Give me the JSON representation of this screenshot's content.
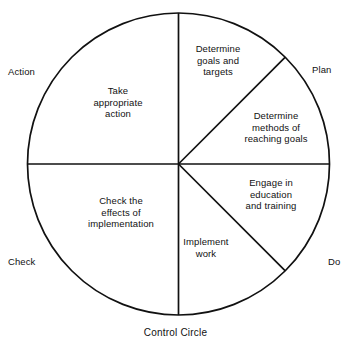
{
  "caption": "Control Circle",
  "geometry": {
    "center_x": 178.5,
    "center_y": 164,
    "radius": 151
  },
  "outer_labels": [
    {
      "id": "action",
      "label": "Action"
    },
    {
      "id": "plan",
      "label": "Plan"
    },
    {
      "id": "check",
      "label": "Check"
    },
    {
      "id": "do",
      "label": "Do"
    }
  ],
  "sectors": [
    {
      "id": "plan-goals",
      "phase": "Plan",
      "label": "Determine\ngoals and\ntargets"
    },
    {
      "id": "plan-methods",
      "phase": "Plan",
      "label": "Determine\nmethods of\nreaching goals"
    },
    {
      "id": "do-educate",
      "phase": "Do",
      "label": "Engage in\neducation\nand training"
    },
    {
      "id": "do-implement",
      "phase": "Do",
      "label": "Implement\nwork"
    },
    {
      "id": "check-effects",
      "phase": "Check",
      "label": "Check the\neffects of\nimplementation"
    },
    {
      "id": "action-take",
      "phase": "Action",
      "label": "Take\nappropriate\naction"
    }
  ],
  "colors": {
    "stroke": "#111111",
    "background": "#ffffff",
    "text": "#111111"
  }
}
